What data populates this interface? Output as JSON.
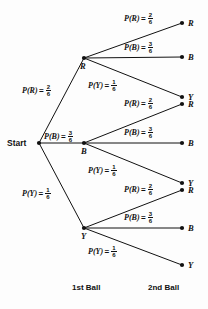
{
  "diagram": {
    "start_label": "Start",
    "columns": [
      {
        "id": "first-ball",
        "label": "1st Ball"
      },
      {
        "id": "second-ball",
        "label": "2nd Ball"
      }
    ],
    "outcome_letters": {
      "red": "R",
      "blue": "B",
      "yellow": "Y"
    },
    "probability_fn": {
      "red": "P(R)",
      "blue": "P(B)",
      "yellow": "P(Y)"
    },
    "equals": "=",
    "fractions": {
      "red": {
        "numerator": "2",
        "denominator": "6"
      },
      "blue": {
        "numerator": "3",
        "denominator": "6"
      },
      "yellow": {
        "numerator": "1",
        "denominator": "6"
      }
    },
    "first_ball_nodes": [
      {
        "id": "first-red",
        "letter": "R",
        "prob_fn": "P(R)",
        "num": "2",
        "den": "6"
      },
      {
        "id": "first-blue",
        "letter": "B",
        "prob_fn": "P(B)",
        "num": "3",
        "den": "6"
      },
      {
        "id": "first-yellow",
        "letter": "Y",
        "prob_fn": "P(Y)",
        "num": "1",
        "den": "6"
      }
    ],
    "second_ball_groups": [
      {
        "id": "from-red",
        "parent": "R",
        "branches": [
          {
            "id": "red-red",
            "letter": "R",
            "prob_fn": "P(R)",
            "num": "2",
            "den": "6"
          },
          {
            "id": "red-blue",
            "letter": "B",
            "prob_fn": "P(B)",
            "num": "3",
            "den": "6"
          },
          {
            "id": "red-yellow",
            "letter": "Y",
            "prob_fn": "P(Y)",
            "num": "1",
            "den": "6"
          }
        ]
      },
      {
        "id": "from-blue",
        "parent": "B",
        "branches": [
          {
            "id": "blue-red",
            "letter": "R",
            "prob_fn": "P(R)",
            "num": "2",
            "den": "6"
          },
          {
            "id": "blue-blue",
            "letter": "B",
            "prob_fn": "P(B)",
            "num": "3",
            "den": "6"
          },
          {
            "id": "blue-yellow",
            "letter": "Y",
            "prob_fn": "P(Y)",
            "num": "1",
            "den": "6"
          }
        ]
      },
      {
        "id": "from-yellow",
        "parent": "Y",
        "branches": [
          {
            "id": "yellow-red",
            "letter": "R",
            "prob_fn": "P(R)",
            "num": "2",
            "den": "6"
          },
          {
            "id": "yellow-blue",
            "letter": "B",
            "prob_fn": "P(B)",
            "num": "3",
            "den": "6"
          },
          {
            "id": "yellow-yellow",
            "letter": "Y",
            "prob_fn": "P(Y)",
            "num": "1",
            "den": "6"
          }
        ]
      }
    ],
    "colors": {
      "ink": "#111111",
      "background": "#fdfdfd"
    }
  }
}
